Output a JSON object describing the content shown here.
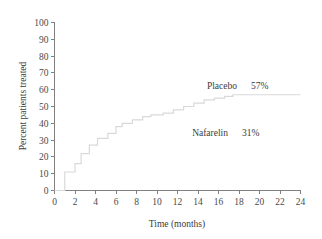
{
  "chart_data": {
    "type": "line",
    "subtype": "step",
    "title": "",
    "xlabel": "Time (months)",
    "ylabel": "Percent patients treated",
    "xlim": [
      0,
      24
    ],
    "ylim": [
      0,
      100
    ],
    "xticks": [
      0,
      2,
      4,
      6,
      8,
      10,
      12,
      14,
      16,
      18,
      20,
      22,
      24
    ],
    "xtick_labels": [
      "0",
      "2",
      "4",
      "6",
      "8",
      "10",
      "12",
      "14",
      "16",
      "18",
      "20",
      "22",
      "24"
    ],
    "yticks": [
      0,
      10,
      20,
      30,
      40,
      50,
      60,
      70,
      80,
      90,
      100
    ],
    "ytick_labels": [
      "0",
      "10",
      "20",
      "30",
      "40",
      "50",
      "60",
      "70",
      "80",
      "90",
      "100"
    ],
    "grid": false,
    "legend_position": "inside-right",
    "series": [
      {
        "name": "Placebo",
        "final_value": 57,
        "color": "#d9d9d9",
        "x": [
          0,
          1,
          1,
          2,
          2,
          2.6,
          2.6,
          3.4,
          3.4,
          4.2,
          4.2,
          5.2,
          5.2,
          6,
          6,
          6.6,
          6.6,
          7.6,
          7.6,
          8.6,
          8.6,
          9.4,
          9.4,
          10.6,
          10.6,
          11.6,
          11.6,
          12.6,
          12.6,
          13.6,
          13.6,
          14.6,
          14.6,
          15.6,
          15.6,
          16.6,
          16.6,
          17.4,
          17.4,
          24
        ],
        "y": [
          0,
          0,
          11,
          11,
          16,
          16,
          22,
          22,
          27,
          27,
          31,
          31,
          34,
          34,
          38,
          38,
          40,
          40,
          42,
          42,
          44,
          44,
          45,
          45,
          46,
          46,
          48,
          48,
          50,
          50,
          52,
          52,
          54,
          54,
          55,
          55,
          56,
          56,
          57,
          57
        ]
      }
    ],
    "annotations": [
      {
        "id": "placebo",
        "label": "Placebo",
        "value": "57%",
        "x_px": 237,
        "y_px": 89
      },
      {
        "id": "nafarelin",
        "label": "Nafarelin",
        "value": "31%",
        "x_px": 228,
        "y_px": 136
      }
    ]
  },
  "axis": {
    "y_title": "Percent patients treated",
    "x_title": "Time (months)"
  }
}
